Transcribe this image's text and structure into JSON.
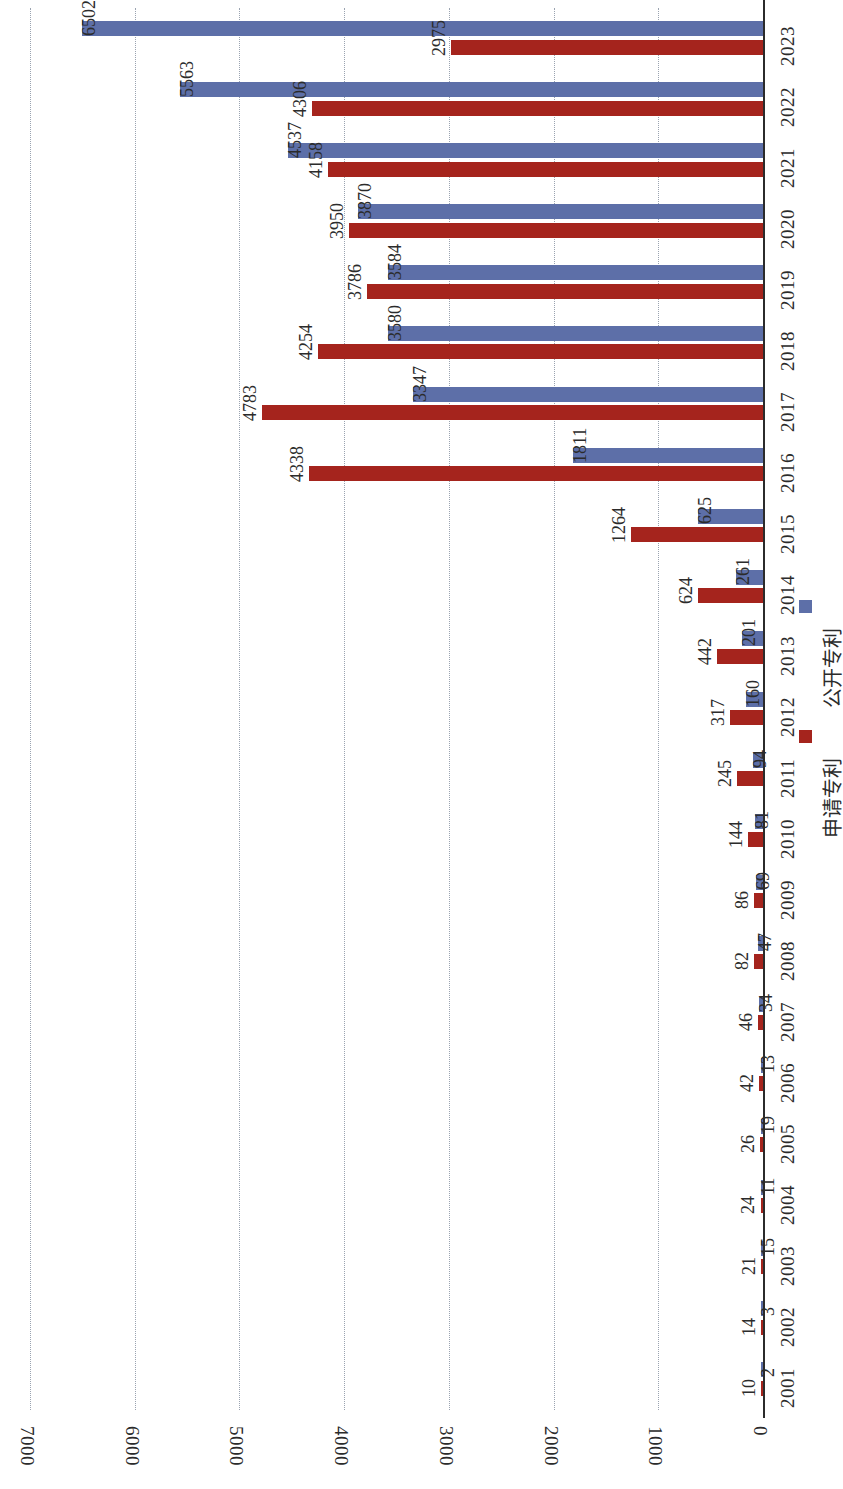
{
  "chart_data": {
    "type": "bar",
    "orientation": "horizontal",
    "title": "",
    "xlabel": "",
    "ylabel": "单位：件",
    "unit_note": "单位：件",
    "grid": true,
    "legend_position": "right-middle",
    "value_axis": {
      "min": 0,
      "max": 7000,
      "ticks": [
        0,
        1000,
        2000,
        3000,
        4000,
        5000,
        6000,
        7000
      ],
      "tick_labels": [
        "0",
        "1000",
        "2000",
        "3000",
        "4000",
        "5000",
        "6000",
        "7000"
      ]
    },
    "categories": [
      "2001",
      "2002",
      "2003",
      "2004",
      "2005",
      "2006",
      "2007",
      "2008",
      "2009",
      "2010",
      "2011",
      "2012",
      "2013",
      "2014",
      "2015",
      "2016",
      "2017",
      "2018",
      "2019",
      "2020",
      "2021",
      "2022",
      "2023"
    ],
    "series": [
      {
        "name": "申请专利",
        "color": "#a5241d",
        "values": [
          10,
          14,
          21,
          24,
          26,
          42,
          46,
          82,
          86,
          144,
          245,
          317,
          442,
          624,
          1264,
          4338,
          4783,
          4254,
          3786,
          3950,
          4158,
          4306,
          2975
        ]
      },
      {
        "name": "公开专利",
        "color": "#5d6fa8",
        "values": [
          2,
          3,
          15,
          11,
          19,
          13,
          34,
          47,
          69,
          81,
          94,
          160,
          201,
          261,
          625,
          1811,
          3347,
          3580,
          3584,
          3870,
          4537,
          5563,
          6502
        ]
      }
    ]
  },
  "legend": {
    "items": [
      {
        "label": "公开专利",
        "color": "#5d6fa8",
        "key": "pub"
      },
      {
        "label": "申请专利",
        "color": "#a5241d",
        "key": "app"
      }
    ]
  },
  "colors": {
    "published": "#5d6fa8",
    "applied": "#a5241d",
    "gridline": "#9aa3b0",
    "axis": "#2b2b2b",
    "background": "#ffffff"
  }
}
